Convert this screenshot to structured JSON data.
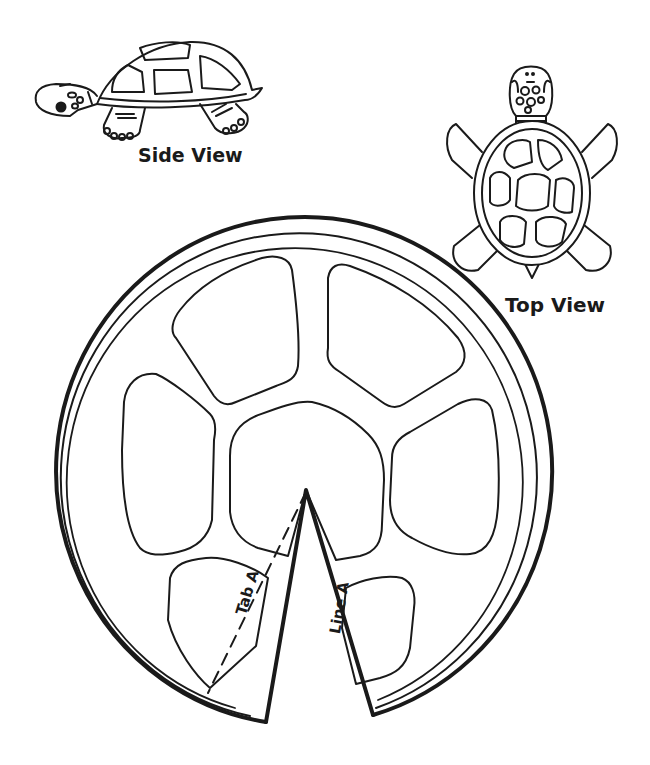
{
  "figure": {
    "stroke_color": "#1a1a1a",
    "background": "#ffffff"
  },
  "side_view": {
    "label": "Side View"
  },
  "top_view": {
    "label": "Top View"
  },
  "shell_template": {
    "tab_label": "Tab A",
    "line_label": "Line A",
    "scute_count": 8
  }
}
